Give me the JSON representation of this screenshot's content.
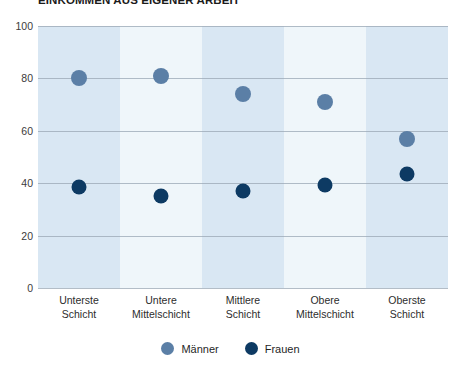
{
  "chart_data": {
    "type": "scatter",
    "title": "EINKOMMEN AUS EIGENER ARBEIT",
    "xlabel": "",
    "ylabel": "",
    "ylim": [
      0,
      100
    ],
    "yticks": [
      "0",
      "20",
      "40",
      "60",
      "80",
      "100"
    ],
    "grid": true,
    "legend_position": "bottom-center",
    "categories": [
      {
        "line1": "Unterste",
        "line2": "Schicht"
      },
      {
        "line1": "Untere",
        "line2": "Mittelschicht"
      },
      {
        "line1": "Mittlere",
        "line2": "Schicht"
      },
      {
        "line1": "Obere",
        "line2": "Mittelschicht"
      },
      {
        "line1": "Oberste",
        "line2": "Schicht"
      }
    ],
    "series": [
      {
        "name": "Männer",
        "color": "#5b7fa6",
        "values": [
          80,
          81,
          74,
          71,
          57
        ]
      },
      {
        "name": "Frauen",
        "color": "#0d3a63",
        "values": [
          38.5,
          35,
          37,
          39.5,
          43.5
        ]
      }
    ],
    "band_colors": [
      "#d9e7f3",
      "#eff6fa"
    ],
    "gridline_color": "#9aa7b4"
  },
  "legend": {
    "items": [
      {
        "label": "Männer",
        "color": "#5b7fa6"
      },
      {
        "label": "Frauen",
        "color": "#0d3a63"
      }
    ]
  }
}
